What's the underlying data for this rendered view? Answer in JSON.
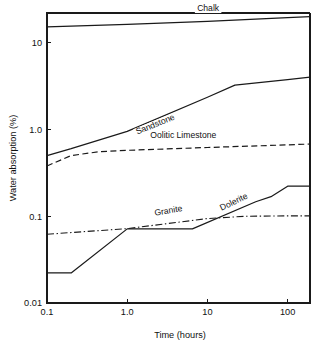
{
  "chart_data": {
    "type": "line",
    "title": "",
    "xlabel": "Time (hours)",
    "ylabel": "Water absorption (%)",
    "xscale": "log",
    "yscale": "log",
    "xlim": [
      0.1,
      190
    ],
    "ylim": [
      0.01,
      22
    ],
    "grid": false,
    "legend_position": "inline-labels",
    "xticks": [
      {
        "value": 0.1,
        "label": "0.1"
      },
      {
        "value": 1.0,
        "label": "1.0"
      },
      {
        "value": 10,
        "label": "10"
      },
      {
        "value": 100,
        "label": "100"
      }
    ],
    "yticks": [
      {
        "value": 0.01,
        "label": "0.01"
      },
      {
        "value": 0.1,
        "label": "0.1"
      },
      {
        "value": 1.0,
        "label": "1.0"
      },
      {
        "value": 10,
        "label": "10"
      }
    ],
    "series": [
      {
        "name": "Chalk",
        "style": "solid",
        "label_x": 10.2,
        "label_y": 23.5,
        "x": [
          0.1,
          1.0,
          10,
          100,
          190
        ],
        "y": [
          15.2,
          16.3,
          17.6,
          19.4,
          20.0
        ]
      },
      {
        "name": "Sandstone",
        "style": "solid",
        "label_x": 2.3,
        "label_y": 1.07,
        "x": [
          0.1,
          0.2,
          1.0,
          10,
          22,
          100,
          190
        ],
        "y": [
          0.5,
          0.6,
          0.95,
          2.35,
          3.25,
          3.75,
          4.0
        ]
      },
      {
        "name": "Oolitic Limestone",
        "style": "dashed",
        "label_x": 5.0,
        "label_y": 0.8,
        "x": [
          0.1,
          0.2,
          0.45,
          1.0,
          10,
          100,
          190
        ],
        "y": [
          0.38,
          0.5,
          0.555,
          0.575,
          0.62,
          0.665,
          0.68
        ]
      },
      {
        "name": "Granite",
        "style": "dashdot",
        "label_x": 3.3,
        "label_y": 0.108,
        "x": [
          0.1,
          1.0,
          10,
          30,
          100,
          190
        ],
        "y": [
          0.062,
          0.072,
          0.094,
          0.1,
          0.101,
          0.101
        ]
      },
      {
        "name": "Dolerite",
        "style": "solid",
        "label_x": 22,
        "label_y": 0.137,
        "x": [
          0.1,
          0.2,
          1.0,
          6.5,
          40,
          62,
          100,
          190
        ],
        "y": [
          0.0222,
          0.0222,
          0.0715,
          0.0715,
          0.147,
          0.168,
          0.222,
          0.222
        ]
      }
    ]
  }
}
